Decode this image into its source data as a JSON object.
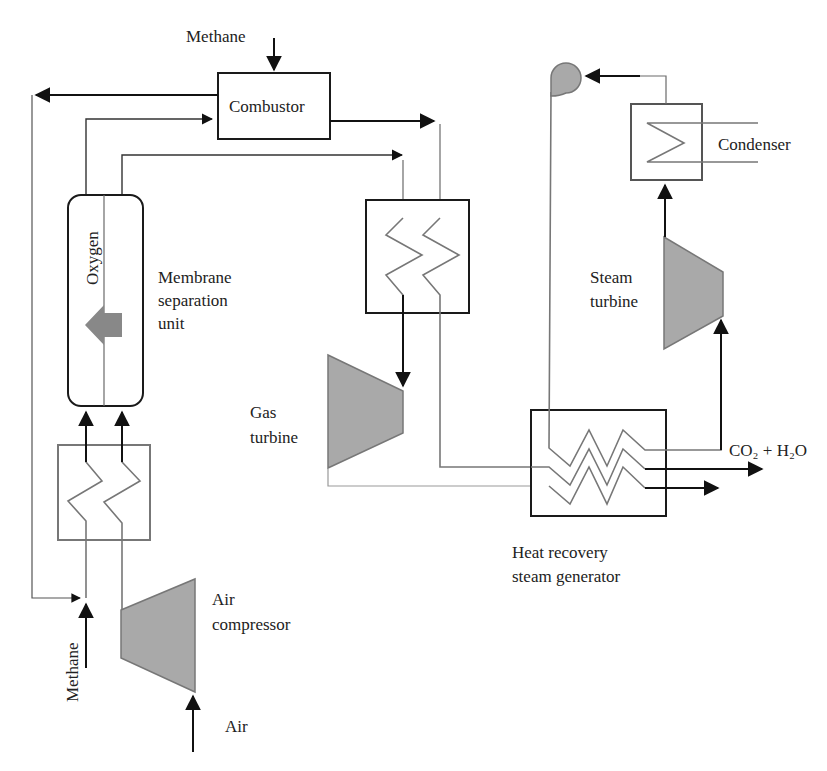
{
  "figure": {
    "colors": {
      "line_dark": "#111111",
      "line_gray": "#6a6a6a",
      "equipment_fill": "#a9a9a9",
      "background": "#ffffff"
    }
  },
  "components": {
    "combustor": {
      "label": "Combustor"
    },
    "membrane_unit": {
      "label_line1": "Membrane",
      "label_line2": "separation",
      "label_line3": "unit",
      "inner_label": "Oxygen"
    },
    "gas_turbine": {
      "label_line1": "Gas",
      "label_line2": "turbine"
    },
    "air_compressor": {
      "label_line1": "Air",
      "label_line2": "compressor"
    },
    "hrsg": {
      "label_line1": "Heat recovery",
      "label_line2": "steam generator"
    },
    "steam_turbine": {
      "label_line1": "Steam",
      "label_line2": "turbine"
    },
    "condenser": {
      "label": "Condenser"
    },
    "pump": {
      "label": ""
    },
    "left_heat_exchanger": {
      "label": ""
    },
    "middle_heat_exchanger": {
      "label": ""
    }
  },
  "streams": {
    "methane_top": "Methane",
    "methane_bottom": "Methane",
    "air_inlet": "Air",
    "exhaust": "CO₂ + H₂O"
  },
  "icons": {
    "permeation_arrow": "left-arrow",
    "pump": "pump-icon",
    "turbine": "trapezoid"
  }
}
